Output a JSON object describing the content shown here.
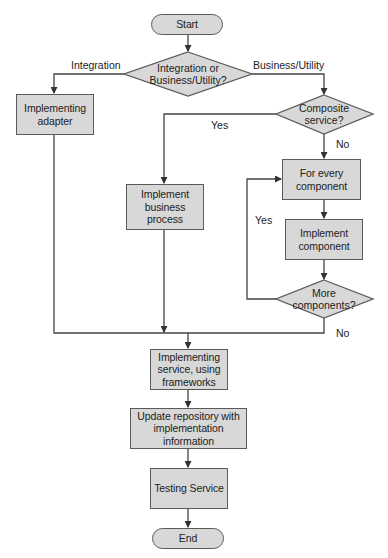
{
  "flowchart": {
    "nodes": {
      "start": {
        "label": "Start",
        "shape": "terminator"
      },
      "decision_type": {
        "label": "Integration or\nBusiness/Utility?",
        "shape": "decision"
      },
      "implementing_adapter": {
        "label": "Implementing\nadapter",
        "shape": "process"
      },
      "decision_composite": {
        "label": "Composite\nservice?",
        "shape": "decision"
      },
      "implement_business_process": {
        "label": "Implement\nbusiness\nprocess",
        "shape": "process"
      },
      "for_every_component": {
        "label": "For every\ncomponent",
        "shape": "process"
      },
      "implement_component": {
        "label": "Implement\ncomponent",
        "shape": "process"
      },
      "decision_more": {
        "label": "More\ncomponents?",
        "shape": "decision"
      },
      "implementing_service": {
        "label": "Implementing\nservice, using\nframeworks",
        "shape": "process"
      },
      "update_repository": {
        "label": "Update repository with\nimplementation\ninformation",
        "shape": "process"
      },
      "testing_service": {
        "label": "Testing Service",
        "shape": "process"
      },
      "end": {
        "label": "End",
        "shape": "terminator"
      }
    },
    "edge_labels": {
      "integration": "Integration",
      "business_utility": "Business/Utility",
      "composite_yes": "Yes",
      "composite_no": "No",
      "more_yes": "Yes",
      "more_no": "No"
    },
    "colors": {
      "fill": "#d8d8d8",
      "stroke": "#5a5a5a",
      "text": "#222222"
    }
  }
}
